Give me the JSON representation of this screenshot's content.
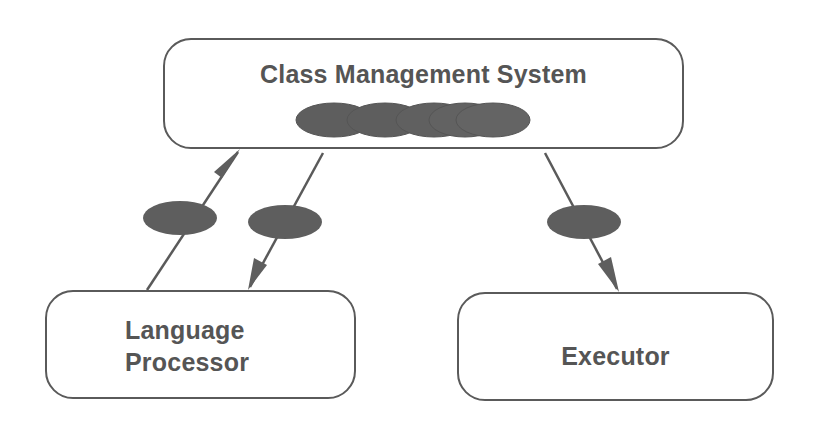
{
  "diagram": {
    "nodes": [
      {
        "id": "cms",
        "label": "Class Management System"
      },
      {
        "id": "lp",
        "label_line1": "Language",
        "label_line2": "Processor"
      },
      {
        "id": "ex",
        "label": "Executor"
      }
    ],
    "edges": [
      {
        "from": "lp",
        "to": "cms",
        "has_token": true
      },
      {
        "from": "cms",
        "to": "lp",
        "has_token": true
      },
      {
        "from": "cms",
        "to": "ex",
        "has_token": true
      }
    ],
    "cms_token_stack_count": 5
  },
  "colors": {
    "stroke": "#5a5a5a",
    "token_fill": "#5e5e5e",
    "text": "#555555",
    "background": "#ffffff"
  }
}
